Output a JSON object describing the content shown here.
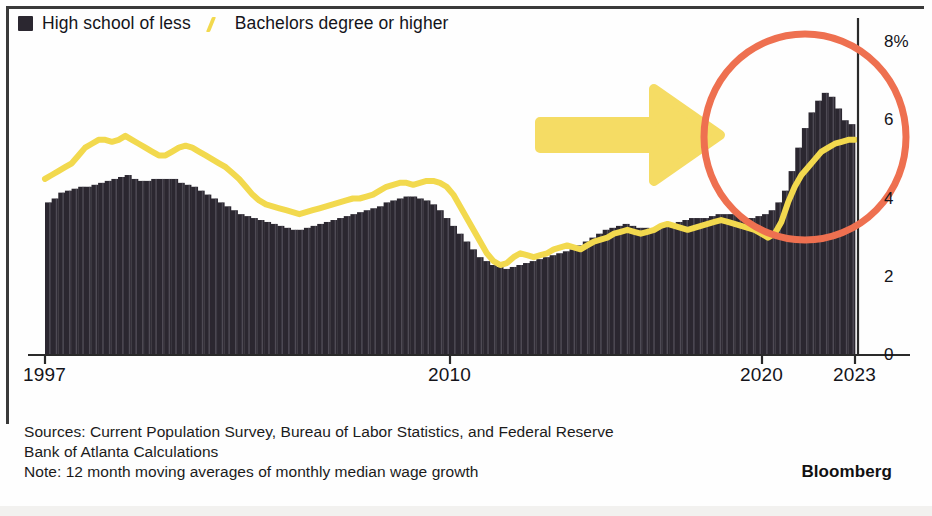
{
  "legend": {
    "items": [
      {
        "label": "High school of less",
        "marker": "bar-swatch-icon",
        "color": "#2b2730"
      },
      {
        "label": "Bachelors degree or higher",
        "marker": "line-swatch-icon",
        "color": "#F2D94E"
      }
    ]
  },
  "footer": {
    "line1": "Sources: Current Population Survey, Bureau of Labor Statistics, and Federal Reserve",
    "line2": "Bank of Atlanta Calculations",
    "line3": "Note: 12 month moving averages of monthly median wage growth",
    "brand": "Bloomberg"
  },
  "annotations": {
    "circle": {
      "name": "orange-highlight-circle",
      "color": "#EE7050",
      "cx": 805,
      "cy": 137,
      "r": 101,
      "stroke_width": 7
    },
    "arrow": {
      "name": "yellow-pointer-arrow",
      "color": "#F5DC64",
      "from_x": 540,
      "to_x": 720,
      "y": 135
    }
  },
  "chart_data": {
    "type": "bar",
    "title": "",
    "subtitle": "",
    "xlabel": "",
    "ylabel": "",
    "ylim": [
      0,
      8
    ],
    "yticks": [
      0,
      2,
      4,
      6,
      8
    ],
    "ytick_labels": [
      "0",
      "2",
      "4",
      "6",
      "8%"
    ],
    "xlim": [
      1997.0,
      2023.3
    ],
    "xticks": [
      1997,
      2010,
      2020,
      2023
    ],
    "xtick_labels": [
      "1997",
      "2010",
      "2020",
      "2023"
    ],
    "grid": false,
    "legend_position": "top-left",
    "x_step": 0.25,
    "series": [
      {
        "name": "High school of less",
        "type": "bar",
        "color": "#2b2730",
        "values": [
          3.9,
          4.0,
          4.15,
          4.2,
          4.25,
          4.3,
          4.3,
          4.35,
          4.4,
          4.45,
          4.5,
          4.55,
          4.6,
          4.5,
          4.45,
          4.45,
          4.5,
          4.5,
          4.5,
          4.5,
          4.4,
          4.35,
          4.3,
          4.2,
          4.1,
          4.0,
          3.9,
          3.8,
          3.7,
          3.6,
          3.55,
          3.5,
          3.45,
          3.4,
          3.35,
          3.3,
          3.25,
          3.2,
          3.2,
          3.25,
          3.3,
          3.35,
          3.4,
          3.45,
          3.5,
          3.55,
          3.6,
          3.65,
          3.7,
          3.75,
          3.8,
          3.9,
          3.95,
          4.0,
          4.05,
          4.05,
          4.0,
          3.95,
          3.85,
          3.7,
          3.5,
          3.3,
          3.1,
          2.9,
          2.7,
          2.5,
          2.4,
          2.3,
          2.25,
          2.2,
          2.25,
          2.3,
          2.35,
          2.4,
          2.45,
          2.5,
          2.55,
          2.6,
          2.65,
          2.7,
          2.8,
          2.9,
          3.0,
          3.1,
          3.2,
          3.25,
          3.3,
          3.35,
          3.3,
          3.25,
          3.25,
          3.2,
          3.25,
          3.3,
          3.35,
          3.4,
          3.45,
          3.5,
          3.5,
          3.5,
          3.55,
          3.6,
          3.6,
          3.6,
          3.55,
          3.5,
          3.5,
          3.55,
          3.6,
          3.7,
          3.9,
          4.2,
          4.7,
          5.3,
          5.8,
          6.2,
          6.5,
          6.7,
          6.6,
          6.3,
          6.0,
          5.9
        ]
      },
      {
        "name": "Bachelors degree or higher",
        "type": "line",
        "color": "#F2D94E",
        "values": [
          4.5,
          4.6,
          4.7,
          4.8,
          4.9,
          5.1,
          5.3,
          5.4,
          5.5,
          5.5,
          5.45,
          5.5,
          5.6,
          5.5,
          5.4,
          5.3,
          5.2,
          5.1,
          5.1,
          5.2,
          5.3,
          5.35,
          5.3,
          5.2,
          5.1,
          5.0,
          4.9,
          4.8,
          4.65,
          4.5,
          4.3,
          4.1,
          3.95,
          3.85,
          3.8,
          3.75,
          3.7,
          3.65,
          3.6,
          3.65,
          3.7,
          3.75,
          3.8,
          3.85,
          3.9,
          3.95,
          4.0,
          4.0,
          4.05,
          4.1,
          4.2,
          4.3,
          4.35,
          4.4,
          4.4,
          4.35,
          4.4,
          4.45,
          4.45,
          4.4,
          4.3,
          4.1,
          3.8,
          3.5,
          3.2,
          2.9,
          2.6,
          2.4,
          2.3,
          2.35,
          2.5,
          2.6,
          2.55,
          2.5,
          2.55,
          2.6,
          2.7,
          2.75,
          2.8,
          2.75,
          2.7,
          2.8,
          2.9,
          2.95,
          3.0,
          3.1,
          3.15,
          3.2,
          3.15,
          3.1,
          3.15,
          3.2,
          3.3,
          3.35,
          3.3,
          3.25,
          3.2,
          3.25,
          3.3,
          3.35,
          3.4,
          3.45,
          3.4,
          3.35,
          3.3,
          3.25,
          3.2,
          3.1,
          3.0,
          3.1,
          3.4,
          3.9,
          4.3,
          4.6,
          4.8,
          5.0,
          5.2,
          5.3,
          5.4,
          5.45,
          5.5,
          5.5
        ]
      }
    ]
  }
}
